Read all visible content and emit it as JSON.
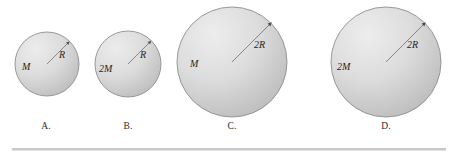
{
  "figure": {
    "background_color": "#ffffff",
    "sphere_fill_light": "#e6e6e6",
    "sphere_fill_mid": "#cdcdcd",
    "sphere_fill_dark": "#b6b6b6",
    "sphere_stroke_color": "#8f8f8f",
    "arrow_color": "#6e6e6e",
    "rule_color": "#c9c9c9"
  },
  "options": [
    {
      "id": "a",
      "label": "A.",
      "mass_label": "M",
      "radius_label": "R",
      "center_x": 47,
      "center_y": 64,
      "radius_px": 32,
      "label_x": 46,
      "label_y": 128
    },
    {
      "id": "b",
      "label": "B.",
      "mass_label": "2M",
      "radius_label": "R",
      "center_x": 128,
      "center_y": 64,
      "radius_px": 33,
      "label_x": 128,
      "label_y": 128
    },
    {
      "id": "c",
      "label": "C.",
      "mass_label": "M",
      "radius_label": "2R",
      "center_x": 232,
      "center_y": 62,
      "radius_px": 55,
      "label_x": 232,
      "label_y": 128
    },
    {
      "id": "d",
      "label": "D.",
      "mass_label": "2M",
      "radius_label": "2R",
      "center_x": 386,
      "center_y": 62,
      "radius_px": 55,
      "label_x": 386,
      "label_y": 128
    }
  ]
}
